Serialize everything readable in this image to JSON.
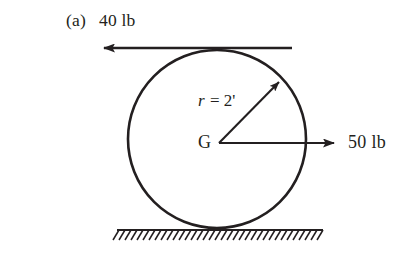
{
  "figure": {
    "kind": "free-body-diagram",
    "part_label": "(a)",
    "background_color": "#ffffff",
    "ink_color": "#231f20",
    "body": {
      "shape": "circle",
      "center_label": "G",
      "radius_label_prefix": "r",
      "radius_label_equals": " = ",
      "radius_label_value": "2'",
      "radius_label_full": "r = 2'",
      "center_px": {
        "x": 217,
        "y": 139
      },
      "radius_px": 89
    },
    "forces": [
      {
        "name": "top-tangential-force",
        "label": "40 lb",
        "magnitude": 40,
        "unit": "lb",
        "direction": "left",
        "application": "top of disk (tangent)",
        "tail_px": {
          "x": 292,
          "y": 48
        },
        "tip_px": {
          "x": 98,
          "y": 48
        }
      },
      {
        "name": "center-horizontal-force",
        "label": "50 lb",
        "magnitude": 50,
        "unit": "lb",
        "direction": "right",
        "application": "center G",
        "tail_px": {
          "x": 219,
          "y": 143
        },
        "tip_px": {
          "x": 340,
          "y": 143
        }
      }
    ],
    "radius_arrow": {
      "name": "radius-dimension-arrow",
      "tail_px": {
        "x": 219,
        "y": 143
      },
      "tip_px": {
        "x": 283,
        "y": 78
      }
    },
    "ground": {
      "name": "ground-surface",
      "line_y_px": 230,
      "x_start_px": 117,
      "x_end_px": 323,
      "hatch_count": 34,
      "hatch_direction": "back-slanted"
    }
  }
}
